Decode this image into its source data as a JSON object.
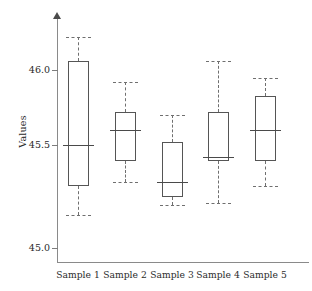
{
  "chart_data": {
    "type": "box",
    "title": "",
    "xlabel": "",
    "ylabel": "Values",
    "ylim": [
      44.85,
      46.25
    ],
    "yticks": [
      45.0,
      45.5,
      46.0
    ],
    "ytick_labels": [
      "45.0",
      "45.5",
      "46.0"
    ],
    "grid": false,
    "legend": false,
    "categories": [
      "Sample 1",
      "Sample 2",
      "Sample 3",
      "Sample 4",
      "Sample 5"
    ],
    "boxes": [
      {
        "category": "Sample 1",
        "whisker_low": 45.16,
        "q1": 45.3,
        "median": 45.5,
        "q3": 46.06,
        "whisker_high": 46.22
      },
      {
        "category": "Sample 2",
        "whisker_low": 45.32,
        "q1": 45.42,
        "median": 45.6,
        "q3": 45.72,
        "whisker_high": 45.92
      },
      {
        "category": "Sample 3",
        "whisker_low": 45.21,
        "q1": 45.25,
        "median": 45.32,
        "q3": 45.52,
        "whisker_high": 45.7
      },
      {
        "category": "Sample 4",
        "whisker_low": 45.22,
        "q1": 45.42,
        "median": 45.44,
        "q3": 45.72,
        "whisker_high": 46.06
      },
      {
        "category": "Sample 5",
        "whisker_low": 45.3,
        "q1": 45.42,
        "median": 45.6,
        "q3": 45.83,
        "whisker_high": 45.95
      }
    ]
  },
  "colors": {
    "axis": "#8a8a8a",
    "box_edge": "#555555",
    "median": "#4a4a4a",
    "whisker": "#6f6f6f",
    "text": "#2b2b2b",
    "background": "#ffffff"
  }
}
